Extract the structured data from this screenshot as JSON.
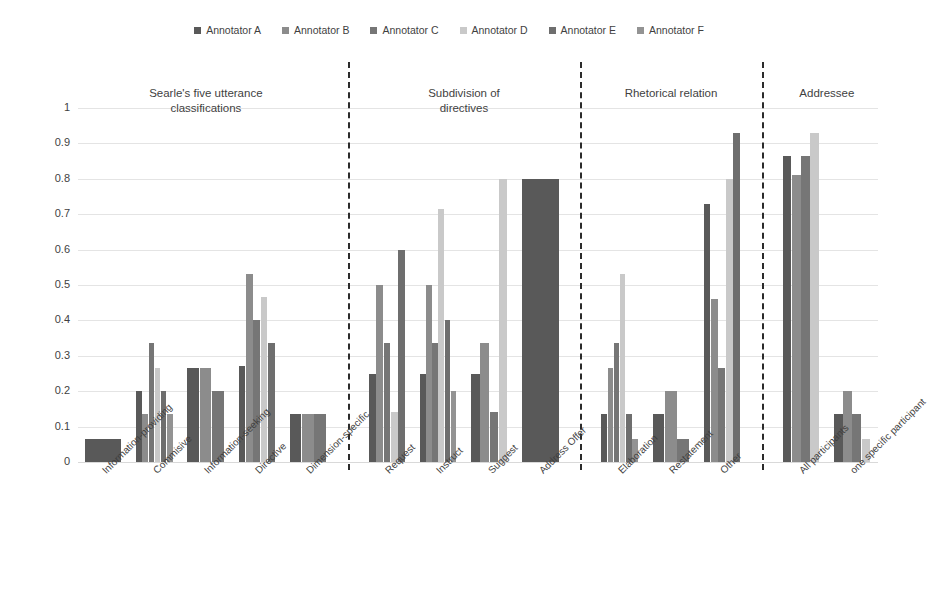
{
  "legend": {
    "items": [
      {
        "label": "Annotator A",
        "color": "#595959"
      },
      {
        "label": "Annotator B",
        "color": "#8c8c8c"
      },
      {
        "label": "Annotator C",
        "color": "#767676"
      },
      {
        "label": "Annotator D",
        "color": "#c9c9c9"
      },
      {
        "label": "Annotator E",
        "color": "#6e6e6e"
      },
      {
        "label": "Annotator F",
        "color": "#939393"
      }
    ]
  },
  "axis": {
    "yticks": [
      "1",
      "0.9",
      "0.8",
      "0.7",
      "0.6",
      "0.5",
      "0.4",
      "0.3",
      "0.2",
      "0.1",
      "0"
    ]
  },
  "groups": [
    {
      "title_line1": "Searle's five utterance",
      "title_line2": "classifications"
    },
    {
      "title_line1": "Subdivision of",
      "title_line2": "directives"
    },
    {
      "title_line1": "Rhetorical relation",
      "title_line2": ""
    },
    {
      "title_line1": "Addressee",
      "title_line2": ""
    }
  ],
  "chart_data": {
    "type": "bar",
    "title": "",
    "xlabel": "",
    "ylabel": "",
    "ylim": [
      0,
      1
    ],
    "ytick_step": 0.1,
    "grid": true,
    "legend_position": "top-center",
    "series": [
      {
        "name": "Annotator A",
        "color": "#595959"
      },
      {
        "name": "Annotator B",
        "color": "#8c8c8c"
      },
      {
        "name": "Annotator C",
        "color": "#767676"
      },
      {
        "name": "Annotator D",
        "color": "#c9c9c9"
      },
      {
        "name": "Annotator E",
        "color": "#6e6e6e"
      },
      {
        "name": "Annotator F",
        "color": "#939393"
      }
    ],
    "panels": [
      {
        "title": "Searle's five utterance classifications",
        "categories": [
          "Information-providing",
          "Commisive",
          "Information-seeking",
          "Directive",
          "Dimension-specific"
        ],
        "values": [
          [
            0.065,
            0.0,
            0.0,
            0.0,
            0.0,
            0.0
          ],
          [
            0.2,
            0.135,
            0.335,
            0.265,
            0.2,
            0.135
          ],
          [
            0.265,
            0.265,
            0.2,
            0.0,
            0.0,
            0.0
          ],
          [
            0.27,
            0.53,
            0.4,
            0.465,
            0.335,
            0.0
          ],
          [
            0.135,
            0.135,
            0.135,
            0.0,
            0.0,
            0.0
          ]
        ]
      },
      {
        "title": "Subdivision of directives",
        "categories": [
          "Request",
          "Instruct",
          "Suggest",
          "Address Offer"
        ],
        "values": [
          [
            0.25,
            0.5,
            0.335,
            0.14,
            0.6,
            0.0
          ],
          [
            0.25,
            0.5,
            0.335,
            0.715,
            0.4,
            0.2
          ],
          [
            0.25,
            0.335,
            0.14,
            0.8,
            0.0,
            0.0
          ],
          [
            0.8,
            0.0,
            0.0,
            0.0,
            0.0,
            0.0
          ]
        ]
      },
      {
        "title": "Rhetorical relation",
        "categories": [
          "Elaboration",
          "Restatement",
          "Other"
        ],
        "values": [
          [
            0.135,
            0.265,
            0.335,
            0.53,
            0.135,
            0.065
          ],
          [
            0.135,
            0.2,
            0.065,
            0.0,
            0.0,
            0.0
          ],
          [
            0.73,
            0.46,
            0.265,
            0.8,
            0.93,
            0.0
          ]
        ]
      },
      {
        "title": "Addressee",
        "categories": [
          "All participants",
          "one specific participant"
        ],
        "values": [
          [
            0.865,
            0.81,
            0.865,
            0.93,
            0.0,
            0.0
          ],
          [
            0.135,
            0.2,
            0.135,
            0.065,
            0.0,
            0.0
          ]
        ]
      }
    ]
  }
}
